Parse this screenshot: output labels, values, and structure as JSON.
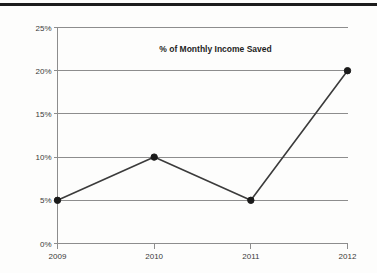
{
  "chart_data": {
    "type": "line",
    "title": "% of Monthly Income Saved",
    "xlabel": "",
    "ylabel": "",
    "categories": [
      "2009",
      "2010",
      "2011",
      "2012"
    ],
    "values": [
      5,
      10,
      5,
      20
    ],
    "value_suffix": "%",
    "ylim": [
      0,
      25
    ],
    "yticks": [
      0,
      5,
      10,
      15,
      20,
      25
    ],
    "ytick_labels": [
      "0%",
      "5%",
      "10%",
      "15%",
      "20%",
      "25%"
    ],
    "grid": true,
    "legend": "none",
    "series": [
      {
        "name": "% of Monthly Income Saved",
        "values": [
          5,
          10,
          5,
          20
        ]
      }
    ],
    "colors": {
      "line": "#3b3b3b",
      "marker": "#1a1a1a",
      "gridline": "#8d8d8d",
      "axis": "#8d8d8d",
      "text": "#3a3a3a",
      "background": "#fdfdfc",
      "top_rule": "#1c1c1c"
    },
    "points": [
      {
        "x": "2009",
        "y": 5,
        "label": "5%"
      },
      {
        "x": "2010",
        "y": 10,
        "label": "10%"
      },
      {
        "x": "2011",
        "y": 5,
        "label": "5%"
      },
      {
        "x": "2012",
        "y": 20,
        "label": "20%"
      }
    ]
  }
}
